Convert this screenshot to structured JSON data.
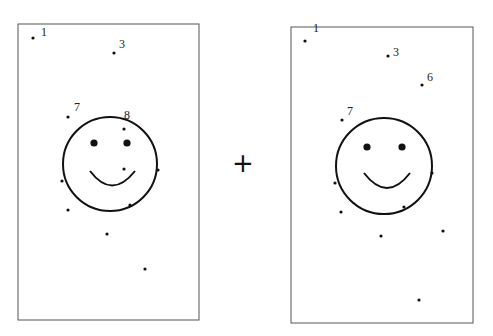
{
  "figure": {
    "operator": "+",
    "panels": [
      {
        "name": "left",
        "frame": {
          "x": 18,
          "y": 24,
          "w": 181,
          "h": 296
        },
        "face": {
          "cx": 110,
          "cy": 164,
          "r": 47,
          "eyes": [
            {
              "x": 94,
              "y": 143
            },
            {
              "x": 127,
              "y": 143
            }
          ],
          "smile": "M 90 171 Q 112 200 135 171"
        },
        "labeled_points": [
          {
            "label": "1",
            "x": 33,
            "y": 38,
            "lx": 41,
            "ly": 36
          },
          {
            "label": "3",
            "x": 114,
            "y": 53,
            "lx": 119,
            "ly": 48
          },
          {
            "label": "7",
            "x": 68,
            "y": 117,
            "lx": 74,
            "ly": 111
          },
          {
            "label": "8",
            "x": 124,
            "y": 129,
            "lx": 124,
            "ly": 119
          }
        ],
        "points": [
          {
            "x": 124,
            "y": 169
          },
          {
            "x": 62,
            "y": 181
          },
          {
            "x": 158,
            "y": 170
          },
          {
            "x": 130,
            "y": 205
          },
          {
            "x": 68,
            "y": 210
          },
          {
            "x": 107,
            "y": 234
          },
          {
            "x": 145,
            "y": 269
          }
        ]
      },
      {
        "name": "right",
        "frame": {
          "x": 291,
          "y": 27,
          "w": 182,
          "h": 296
        },
        "face": {
          "cx": 384,
          "cy": 166,
          "r": 48,
          "eyes": [
            {
              "x": 367,
              "y": 147
            },
            {
              "x": 402,
              "y": 147
            }
          ],
          "smile": "M 364 173 Q 387 203 410 173"
        },
        "labeled_points": [
          {
            "label": "1",
            "x": 305,
            "y": 41,
            "lx": 313,
            "ly": 32
          },
          {
            "label": "3",
            "x": 388,
            "y": 56,
            "lx": 393,
            "ly": 56
          },
          {
            "label": "6",
            "x": 422,
            "y": 85,
            "lx": 427,
            "ly": 81
          },
          {
            "label": "7",
            "x": 342,
            "y": 120,
            "lx": 347,
            "ly": 115
          }
        ],
        "points": [
          {
            "x": 335,
            "y": 183
          },
          {
            "x": 432,
            "y": 173
          },
          {
            "x": 404,
            "y": 207
          },
          {
            "x": 341,
            "y": 212
          },
          {
            "x": 381,
            "y": 236
          },
          {
            "x": 443,
            "y": 231
          },
          {
            "x": 419,
            "y": 300
          }
        ]
      }
    ]
  }
}
